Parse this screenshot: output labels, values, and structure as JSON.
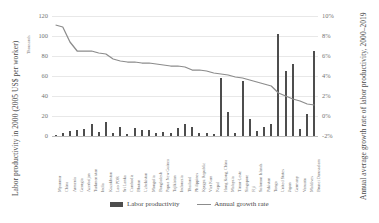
{
  "axes": {
    "left_title": "Labor productivity in 2000 (2005 US$ per worker)",
    "left_unit": "Thousands",
    "right_title": "Annual average growth rate of labor productivity, 2000–2019",
    "left_ticks": [
      "120",
      "100",
      "80",
      "60",
      "40",
      "20",
      "0"
    ],
    "right_ticks": [
      "10%",
      "8%",
      "6%",
      "4%",
      "2%",
      "0%",
      "-2%"
    ]
  },
  "legend": {
    "bar_label": "Labor productivity",
    "line_label": "Annual growth rate",
    "bar_color": "#4d4d4d",
    "line_color": "#8c8c8c"
  },
  "chart_data": {
    "type": "bar",
    "title": "",
    "xlabel": "",
    "ylabel": "Labor productivity in 2000 (2005 US$ per worker)",
    "y2label": "Annual average growth rate of labor productivity, 2000–2019",
    "ylim": [
      0,
      120
    ],
    "y2lim": [
      -2,
      10
    ],
    "grid": true,
    "legend_position": "bottom-center",
    "categories": [
      "Myanmar",
      "China",
      "Armenia",
      "Georgia",
      "Azerbaijan",
      "Turkmenistan",
      "India",
      "Kazakhstan",
      "Lao PDR",
      "Sri Lanka",
      "Cambodia",
      "Bhutan",
      "Uzbekistan",
      "Mongolia",
      "Bangladesh",
      "Papua New Guinea",
      "Tajikistan",
      "Indonesia",
      "Thailand",
      "Philippines",
      "Kyrgyz Republic",
      "Viet Nam",
      "Nepal",
      "Hong Kong, China",
      "Malaysia",
      "Timor-Leste",
      "Singapore",
      "Fiji",
      "Solomon Islands",
      "Pakistan",
      "Tonga",
      "United States",
      "Japan",
      "Germany",
      "Vanuatu",
      "Maldives",
      "Brunei Darussalam"
    ],
    "series": [
      {
        "name": "Labor productivity",
        "axis": "left",
        "unit": "Thousands of 2005 US$ per worker",
        "values": [
          1.5,
          3.0,
          5.5,
          6.0,
          7.5,
          12.5,
          4.0,
          14.0,
          3.0,
          9.5,
          2.5,
          8.0,
          6.5,
          6.0,
          3.0,
          4.5,
          3.0,
          8.0,
          12.5,
          9.5,
          3.5,
          3.5,
          2.5,
          58.0,
          24.0,
          3.0,
          55.0,
          17.0,
          5.0,
          9.5,
          12.0,
          102.0,
          65.0,
          72.0,
          7.0,
          22.0,
          85.0
        ]
      },
      {
        "name": "Annual growth rate",
        "axis": "right",
        "unit": "percent",
        "values": [
          9.1,
          8.9,
          7.4,
          6.5,
          6.5,
          6.5,
          6.3,
          6.2,
          5.7,
          5.5,
          5.4,
          5.4,
          5.3,
          5.3,
          5.2,
          5.1,
          5.0,
          5.0,
          4.9,
          4.6,
          4.6,
          4.5,
          4.3,
          4.2,
          4.1,
          3.9,
          3.8,
          3.6,
          3.4,
          3.2,
          3.0,
          2.3,
          2.0,
          1.7,
          1.5,
          1.2,
          1.1
        ]
      }
    ]
  }
}
